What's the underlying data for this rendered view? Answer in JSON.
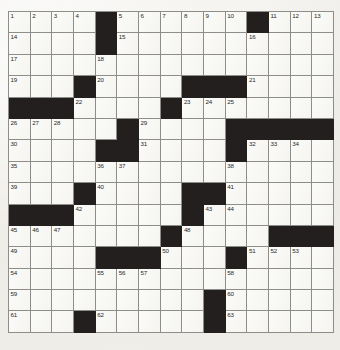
{
  "puzzle": {
    "kind": "crossword-grid",
    "columns": 13,
    "rows": 15,
    "colors": {
      "paper": "#f2f1ee",
      "cell_white": "#f6f5f1",
      "cell_block": "#231f1e",
      "grid_line": "#8d8d8a",
      "number_text": "#2a2724"
    },
    "geometry": {
      "grid_left": 8,
      "grid_top": 11,
      "cell_width": 25,
      "cell_height": 21.4
    },
    "grid": [
      [
        {
          "t": "white",
          "n": "1"
        },
        {
          "t": "white",
          "n": "2"
        },
        {
          "t": "white",
          "n": "3"
        },
        {
          "t": "white",
          "n": "4"
        },
        {
          "t": "block",
          "n": ""
        },
        {
          "t": "white",
          "n": "5"
        },
        {
          "t": "white",
          "n": "6"
        },
        {
          "t": "white",
          "n": "7"
        },
        {
          "t": "white",
          "n": "8"
        },
        {
          "t": "white",
          "n": "9"
        },
        {
          "t": "white",
          "n": "10"
        },
        {
          "t": "block",
          "n": ""
        },
        {
          "t": "white",
          "n": "11"
        },
        {
          "t": "white",
          "n": "12"
        },
        {
          "t": "white",
          "n": "13"
        }
      ],
      [
        {
          "t": "white",
          "n": "14"
        },
        {
          "t": "white",
          "n": ""
        },
        {
          "t": "white",
          "n": ""
        },
        {
          "t": "white",
          "n": ""
        },
        {
          "t": "block",
          "n": ""
        },
        {
          "t": "white",
          "n": "15"
        },
        {
          "t": "white",
          "n": ""
        },
        {
          "t": "white",
          "n": ""
        },
        {
          "t": "white",
          "n": ""
        },
        {
          "t": "white",
          "n": ""
        },
        {
          "t": "white",
          "n": ""
        },
        {
          "t": "white",
          "n": "16"
        },
        {
          "t": "white",
          "n": ""
        },
        {
          "t": "white",
          "n": ""
        },
        {
          "t": "white",
          "n": ""
        }
      ],
      [
        {
          "t": "white",
          "n": "17"
        },
        {
          "t": "white",
          "n": ""
        },
        {
          "t": "white",
          "n": ""
        },
        {
          "t": "white",
          "n": ""
        },
        {
          "t": "white",
          "n": "18"
        },
        {
          "t": "white",
          "n": ""
        },
        {
          "t": "white",
          "n": ""
        },
        {
          "t": "white",
          "n": ""
        },
        {
          "t": "white",
          "n": ""
        },
        {
          "t": "white",
          "n": ""
        },
        {
          "t": "white",
          "n": ""
        },
        {
          "t": "white",
          "n": ""
        },
        {
          "t": "white",
          "n": ""
        },
        {
          "t": "white",
          "n": ""
        },
        {
          "t": "white",
          "n": ""
        }
      ],
      [
        {
          "t": "white",
          "n": "19"
        },
        {
          "t": "white",
          "n": ""
        },
        {
          "t": "white",
          "n": ""
        },
        {
          "t": "block",
          "n": ""
        },
        {
          "t": "white",
          "n": "20"
        },
        {
          "t": "white",
          "n": ""
        },
        {
          "t": "white",
          "n": ""
        },
        {
          "t": "white",
          "n": ""
        },
        {
          "t": "block",
          "n": ""
        },
        {
          "t": "block",
          "n": ""
        },
        {
          "t": "block",
          "n": ""
        },
        {
          "t": "white",
          "n": "21"
        },
        {
          "t": "white",
          "n": ""
        },
        {
          "t": "white",
          "n": ""
        },
        {
          "t": "white",
          "n": ""
        }
      ],
      [
        {
          "t": "block",
          "n": ""
        },
        {
          "t": "block",
          "n": ""
        },
        {
          "t": "block",
          "n": ""
        },
        {
          "t": "white",
          "n": "22"
        },
        {
          "t": "white",
          "n": ""
        },
        {
          "t": "white",
          "n": ""
        },
        {
          "t": "white",
          "n": ""
        },
        {
          "t": "block",
          "n": ""
        },
        {
          "t": "white",
          "n": "23"
        },
        {
          "t": "white",
          "n": "24"
        },
        {
          "t": "white",
          "n": "25"
        },
        {
          "t": "white",
          "n": ""
        },
        {
          "t": "white",
          "n": ""
        },
        {
          "t": "white",
          "n": ""
        },
        {
          "t": "white",
          "n": ""
        }
      ],
      [
        {
          "t": "white",
          "n": "26"
        },
        {
          "t": "white",
          "n": "27"
        },
        {
          "t": "white",
          "n": "28"
        },
        {
          "t": "white",
          "n": ""
        },
        {
          "t": "white",
          "n": ""
        },
        {
          "t": "block",
          "n": ""
        },
        {
          "t": "white",
          "n": "29"
        },
        {
          "t": "white",
          "n": ""
        },
        {
          "t": "white",
          "n": ""
        },
        {
          "t": "white",
          "n": ""
        },
        {
          "t": "block",
          "n": ""
        },
        {
          "t": "block",
          "n": ""
        },
        {
          "t": "block",
          "n": ""
        },
        {
          "t": "block",
          "n": ""
        },
        {
          "t": "block",
          "n": ""
        }
      ],
      [
        {
          "t": "white",
          "n": "30"
        },
        {
          "t": "white",
          "n": ""
        },
        {
          "t": "white",
          "n": ""
        },
        {
          "t": "white",
          "n": ""
        },
        {
          "t": "block",
          "n": ""
        },
        {
          "t": "block",
          "n": ""
        },
        {
          "t": "white",
          "n": "31"
        },
        {
          "t": "white",
          "n": ""
        },
        {
          "t": "white",
          "n": ""
        },
        {
          "t": "white",
          "n": ""
        },
        {
          "t": "block",
          "n": ""
        },
        {
          "t": "white",
          "n": "32"
        },
        {
          "t": "white",
          "n": "33"
        },
        {
          "t": "white",
          "n": "34"
        },
        {
          "t": "white",
          "n": ""
        }
      ],
      [
        {
          "t": "white",
          "n": "35"
        },
        {
          "t": "white",
          "n": ""
        },
        {
          "t": "white",
          "n": ""
        },
        {
          "t": "white",
          "n": ""
        },
        {
          "t": "white",
          "n": "36"
        },
        {
          "t": "white",
          "n": "37"
        },
        {
          "t": "white",
          "n": ""
        },
        {
          "t": "white",
          "n": ""
        },
        {
          "t": "white",
          "n": ""
        },
        {
          "t": "white",
          "n": ""
        },
        {
          "t": "white",
          "n": "38"
        },
        {
          "t": "white",
          "n": ""
        },
        {
          "t": "white",
          "n": ""
        },
        {
          "t": "white",
          "n": ""
        },
        {
          "t": "white",
          "n": ""
        }
      ],
      [
        {
          "t": "white",
          "n": "39"
        },
        {
          "t": "white",
          "n": ""
        },
        {
          "t": "white",
          "n": ""
        },
        {
          "t": "block",
          "n": ""
        },
        {
          "t": "white",
          "n": "40"
        },
        {
          "t": "white",
          "n": ""
        },
        {
          "t": "white",
          "n": ""
        },
        {
          "t": "white",
          "n": ""
        },
        {
          "t": "block",
          "n": ""
        },
        {
          "t": "block",
          "n": ""
        },
        {
          "t": "white",
          "n": "41"
        },
        {
          "t": "white",
          "n": ""
        },
        {
          "t": "white",
          "n": ""
        },
        {
          "t": "white",
          "n": ""
        },
        {
          "t": "white",
          "n": ""
        }
      ],
      [
        {
          "t": "block",
          "n": ""
        },
        {
          "t": "block",
          "n": ""
        },
        {
          "t": "block",
          "n": ""
        },
        {
          "t": "white",
          "n": "42"
        },
        {
          "t": "white",
          "n": ""
        },
        {
          "t": "white",
          "n": ""
        },
        {
          "t": "white",
          "n": ""
        },
        {
          "t": "white",
          "n": ""
        },
        {
          "t": "block",
          "n": ""
        },
        {
          "t": "white",
          "n": "43"
        },
        {
          "t": "white",
          "n": "44"
        },
        {
          "t": "white",
          "n": ""
        },
        {
          "t": "white",
          "n": ""
        },
        {
          "t": "white",
          "n": ""
        },
        {
          "t": "white",
          "n": ""
        }
      ],
      [
        {
          "t": "white",
          "n": "45"
        },
        {
          "t": "white",
          "n": "46"
        },
        {
          "t": "white",
          "n": "47"
        },
        {
          "t": "white",
          "n": ""
        },
        {
          "t": "white",
          "n": ""
        },
        {
          "t": "white",
          "n": ""
        },
        {
          "t": "white",
          "n": ""
        },
        {
          "t": "block",
          "n": ""
        },
        {
          "t": "white",
          "n": "48"
        },
        {
          "t": "white",
          "n": ""
        },
        {
          "t": "white",
          "n": ""
        },
        {
          "t": "white",
          "n": ""
        },
        {
          "t": "block",
          "n": ""
        },
        {
          "t": "block",
          "n": ""
        },
        {
          "t": "block",
          "n": ""
        }
      ],
      [
        {
          "t": "white",
          "n": "49"
        },
        {
          "t": "white",
          "n": ""
        },
        {
          "t": "white",
          "n": ""
        },
        {
          "t": "white",
          "n": ""
        },
        {
          "t": "block",
          "n": ""
        },
        {
          "t": "block",
          "n": ""
        },
        {
          "t": "block",
          "n": ""
        },
        {
          "t": "white",
          "n": "50"
        },
        {
          "t": "white",
          "n": ""
        },
        {
          "t": "white",
          "n": ""
        },
        {
          "t": "block",
          "n": ""
        },
        {
          "t": "white",
          "n": "51"
        },
        {
          "t": "white",
          "n": "52"
        },
        {
          "t": "white",
          "n": "53"
        },
        {
          "t": "white",
          "n": ""
        }
      ],
      [
        {
          "t": "white",
          "n": "54"
        },
        {
          "t": "white",
          "n": ""
        },
        {
          "t": "white",
          "n": ""
        },
        {
          "t": "white",
          "n": ""
        },
        {
          "t": "white",
          "n": "55"
        },
        {
          "t": "white",
          "n": "56"
        },
        {
          "t": "white",
          "n": "57"
        },
        {
          "t": "white",
          "n": ""
        },
        {
          "t": "white",
          "n": ""
        },
        {
          "t": "white",
          "n": ""
        },
        {
          "t": "white",
          "n": "58"
        },
        {
          "t": "white",
          "n": ""
        },
        {
          "t": "white",
          "n": ""
        },
        {
          "t": "white",
          "n": ""
        },
        {
          "t": "white",
          "n": ""
        }
      ],
      [
        {
          "t": "white",
          "n": "59"
        },
        {
          "t": "white",
          "n": ""
        },
        {
          "t": "white",
          "n": ""
        },
        {
          "t": "white",
          "n": ""
        },
        {
          "t": "white",
          "n": ""
        },
        {
          "t": "white",
          "n": ""
        },
        {
          "t": "white",
          "n": ""
        },
        {
          "t": "white",
          "n": ""
        },
        {
          "t": "white",
          "n": ""
        },
        {
          "t": "block",
          "n": ""
        },
        {
          "t": "white",
          "n": "60"
        },
        {
          "t": "white",
          "n": ""
        },
        {
          "t": "white",
          "n": ""
        },
        {
          "t": "white",
          "n": ""
        },
        {
          "t": "white",
          "n": ""
        }
      ],
      [
        {
          "t": "white",
          "n": "61"
        },
        {
          "t": "white",
          "n": ""
        },
        {
          "t": "white",
          "n": ""
        },
        {
          "t": "block",
          "n": ""
        },
        {
          "t": "white",
          "n": "62"
        },
        {
          "t": "white",
          "n": ""
        },
        {
          "t": "white",
          "n": ""
        },
        {
          "t": "white",
          "n": ""
        },
        {
          "t": "white",
          "n": ""
        },
        {
          "t": "block",
          "n": ""
        },
        {
          "t": "white",
          "n": "63"
        },
        {
          "t": "white",
          "n": ""
        },
        {
          "t": "white",
          "n": ""
        },
        {
          "t": "white",
          "n": ""
        },
        {
          "t": "white",
          "n": ""
        }
      ]
    ]
  }
}
